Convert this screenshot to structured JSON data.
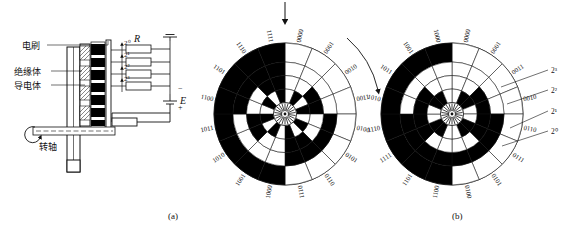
{
  "figure": {
    "caption_a": "(a)",
    "caption_b": "(b)"
  },
  "panel_a": {
    "title_note": "brush-and-disc coding mechanism with resistor network",
    "labels": {
      "brush": "电刷",
      "insulator": "绝缘体",
      "conductor": "导电体",
      "shaft": "转轴",
      "resistor": "R",
      "source": "E",
      "plus": "+",
      "minus": "−",
      "ground": "⏚"
    },
    "bit_weights": [
      "2⁰",
      "2¹",
      "2²",
      "2³"
    ]
  },
  "disc_a": {
    "type": "binary-code-disc",
    "tracks": 4,
    "sectors": 16,
    "codes_clockwise_from_top": [
      "0000",
      "0001",
      "0010",
      "0011",
      "0100",
      "0101",
      "0110",
      "0111",
      "1000",
      "1001",
      "1010",
      "1011",
      "1100",
      "1101",
      "1110",
      "1111"
    ],
    "labels_top_left": [
      "0010",
      "0001",
      "0000"
    ],
    "labels_top_right": [
      "1111",
      "1110",
      "1101",
      "1100"
    ],
    "labels_right_lower": [
      "1011",
      "1010",
      "1001",
      "1000"
    ],
    "labels_bottom_left": [
      "0111",
      "0110",
      "0101",
      "0100"
    ],
    "labels_left": [
      "0011",
      "0010"
    ],
    "indicator_arrow": "down-arrow-at-top",
    "rotation_arrow": "clockwise"
  },
  "disc_b": {
    "type": "gray-code-disc",
    "tracks": 4,
    "sectors": 16,
    "codes_clockwise_from_top": [
      "0000",
      "0001",
      "0011",
      "0010",
      "0110",
      "0111",
      "0101",
      "0100",
      "1100",
      "1101",
      "1111",
      "1110",
      "1010",
      "1011",
      "1001",
      "1000"
    ],
    "labels_top_left": [
      "1010",
      "1011",
      "1001",
      "1000"
    ],
    "labels_top_right": [
      "0000",
      "0001",
      "0011",
      "0010"
    ],
    "labels_right_lower": [
      "0110",
      "0111",
      "1111",
      "1110"
    ],
    "labels_bottom": [
      "1100",
      "0011",
      "0010",
      "1010"
    ],
    "labels_left_lower": [
      "1110",
      "1111",
      "1101",
      "1100"
    ],
    "bit_weights": [
      "2³",
      "2²",
      "2¹",
      "2⁰"
    ]
  },
  "colors": {
    "ink": "#111111",
    "paper": "#ffffff",
    "track_fill": "#000000"
  }
}
